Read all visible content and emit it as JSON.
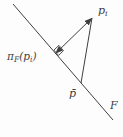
{
  "figure": {
    "colors": {
      "ink": "#3f3f3f",
      "background": "#fdfdfd"
    },
    "labels": {
      "point": {
        "base": "p",
        "sub": "i"
      },
      "projection": {
        "pi": "π",
        "sub_flat": "F",
        "open_paren": "(",
        "arg_base": "p",
        "arg_sub": "i",
        "close_paren": ")"
      },
      "anchor": "p̄",
      "line": "F"
    },
    "geometry": {
      "line_F": {
        "x1": 13,
        "y1": 4,
        "x2": 113,
        "y2": 120
      },
      "segment_pbar_pi": {
        "x1": 81,
        "y1": 83,
        "x2": 92,
        "y2": 18
      },
      "projection_segment": {
        "x1": 55.5,
        "y1": 53.5,
        "x2": 92,
        "y2": 18
      },
      "right_angle_points": "58.5,55.4 63.5,50.7 58.9,45.3 53.9,50.1"
    }
  }
}
